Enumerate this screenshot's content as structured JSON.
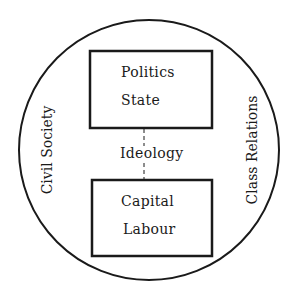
{
  "diagram": {
    "outer_circle": {
      "left_label": "Civil Society",
      "right_label": "Class Relations"
    },
    "top_box": {
      "line1": "Politics",
      "line2": "State"
    },
    "connector_label": "Ideology",
    "bottom_box": {
      "line1": "Capital",
      "line2": "Labour"
    },
    "stroke_color": "#1a1a1a",
    "background": "#ffffff"
  }
}
